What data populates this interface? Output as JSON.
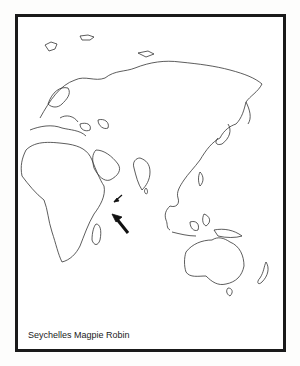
{
  "map": {
    "caption": "Seychelles Magpie Robin",
    "region": "Eastern Hemisphere (Europe, Africa, Asia, Australia)",
    "markers": [
      {
        "type": "small-arrow",
        "points_to": "Seychelles"
      },
      {
        "type": "large-arrow",
        "points_to": "Seychelles"
      }
    ],
    "colors": {
      "frame": "#1a1a1a",
      "coastline": "#333333",
      "background": "#ffffff"
    }
  }
}
